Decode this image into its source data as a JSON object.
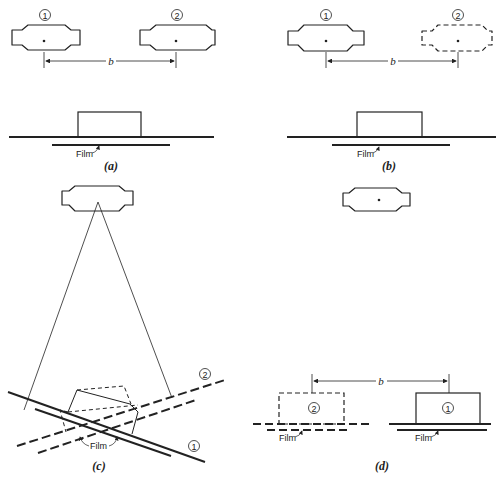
{
  "figure": {
    "panels": [
      {
        "id": "a",
        "caption": "(a)",
        "source_labels": [
          "1",
          "2"
        ],
        "distance_label": "b",
        "film_label": "Film",
        "source_2_style": "solid"
      },
      {
        "id": "b",
        "caption": "(b)",
        "source_labels": [
          "1",
          "2"
        ],
        "distance_label": "b",
        "film_label": "Film",
        "source_2_style": "dashed"
      },
      {
        "id": "c",
        "caption": "(c)",
        "line_labels": [
          "2",
          "1"
        ],
        "film_label": "Film"
      },
      {
        "id": "d",
        "caption": "(d)",
        "object_labels": [
          "2",
          "1"
        ],
        "distance_label": "b",
        "film_labels": [
          "Film",
          "Film"
        ]
      }
    ]
  }
}
